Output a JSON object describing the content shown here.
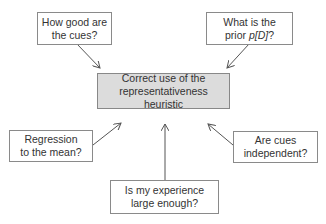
{
  "diagram": {
    "center": {
      "label": "Correct use of the\nrepresentativeness\nheuristic",
      "fill": "#dcdcdc"
    },
    "nodes": [
      {
        "id": "cues-quality",
        "label": "How good are\nthe cues?"
      },
      {
        "id": "prior",
        "label_prefix": "What is the\nprior ",
        "label_math": "p[D]",
        "label_suffix": "?"
      },
      {
        "id": "regression",
        "label": "Regression\nto the mean?"
      },
      {
        "id": "independence",
        "label": "Are cues\nindependent?"
      },
      {
        "id": "sample-size",
        "label": "Is my experience\nlarge enough?"
      }
    ],
    "edges": [
      {
        "from": "cues-quality",
        "to": "center"
      },
      {
        "from": "prior",
        "to": "center"
      },
      {
        "from": "regression",
        "to": "center"
      },
      {
        "from": "independence",
        "to": "center"
      },
      {
        "from": "sample-size",
        "to": "center"
      }
    ],
    "colors": {
      "border": "#8a8a8a",
      "arrow": "#555555",
      "text": "#333333"
    }
  }
}
